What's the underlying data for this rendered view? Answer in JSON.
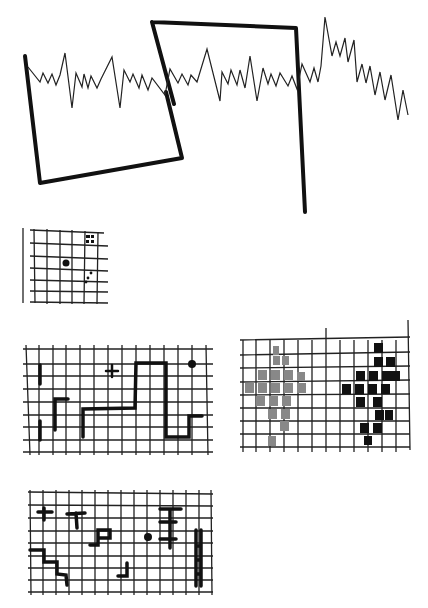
{
  "sketch": {
    "description": "Hand-drawn ink sketch: zigzag line crossing two rectangles, and several hand-drawn grids with marks",
    "panels": [
      {
        "name": "zigzag-with-rectangles",
        "elements": [
          "tilted-square-left",
          "tall-rectangle-right",
          "zigzag-line"
        ]
      },
      {
        "name": "small-grid",
        "marks": [
          "dot",
          "double-dots",
          "diagonal-dots"
        ]
      },
      {
        "name": "grid-path",
        "marks": [
          "vertical-bars",
          "step-path",
          "plus-sign",
          "dot"
        ]
      },
      {
        "name": "grid-shaded",
        "marks": [
          "gray-cluster",
          "black-cluster"
        ]
      },
      {
        "name": "grid-symbols",
        "marks": [
          "t-shapes",
          "staircase",
          "squares",
          "dot",
          "ladder",
          "comb"
        ]
      }
    ],
    "colors": {
      "ink": "#111111",
      "gray_fill": "#888888",
      "background": "#ffffff"
    }
  }
}
